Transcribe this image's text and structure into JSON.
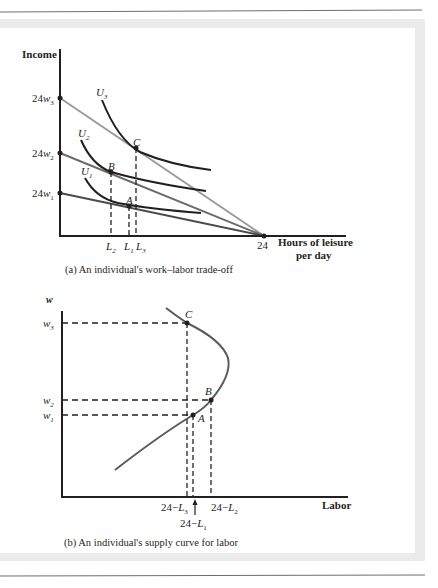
{
  "figure": {
    "panel_a": {
      "caption": "(a) An individual's work–labor trade-off",
      "y_axis_label": "Income",
      "x_axis_label_line1": "Hours of leisure",
      "x_axis_label_line2": "per day",
      "x_tick_24": "24",
      "y_ticks": [
        {
          "coef": "24",
          "var": "w",
          "sub": "3"
        },
        {
          "coef": "24",
          "var": "w",
          "sub": "2"
        },
        {
          "coef": "24",
          "var": "w",
          "sub": "1"
        }
      ],
      "x_ticks": [
        {
          "var": "L",
          "sub": "2"
        },
        {
          "var": "L",
          "sub": "1"
        },
        {
          "var": "L",
          "sub": "3"
        }
      ],
      "curves": [
        {
          "var": "U",
          "sub": "3"
        },
        {
          "var": "U",
          "sub": "2"
        },
        {
          "var": "U",
          "sub": "1"
        }
      ],
      "points": [
        "C",
        "B",
        "A"
      ],
      "colors": {
        "axis": "#231f20",
        "indifference": "#231f20",
        "budget_w3": "#9a9a9a",
        "budget_w2": "#6b6b6b",
        "budget_w1": "#4a4a4a"
      }
    },
    "panel_b": {
      "caption": "(b) An individual's supply curve for labor",
      "y_axis_label": "w",
      "x_axis_label": "Labor",
      "y_ticks": [
        {
          "var": "w",
          "sub": "3"
        },
        {
          "var": "w",
          "sub": "2"
        },
        {
          "var": "w",
          "sub": "1"
        }
      ],
      "x_ticks": [
        {
          "text": "24−",
          "var": "L",
          "sub": "3"
        },
        {
          "text": "24−",
          "var": "L",
          "sub": "2"
        },
        {
          "text": "24−",
          "var": "L",
          "sub": "1"
        }
      ],
      "points": [
        "C",
        "B",
        "A"
      ],
      "colors": {
        "axis": "#231f20",
        "supply_curve": "#5a5a5a"
      }
    },
    "frame_colors": {
      "rule": "#6d6d6d",
      "band": "#ebebeb"
    }
  }
}
